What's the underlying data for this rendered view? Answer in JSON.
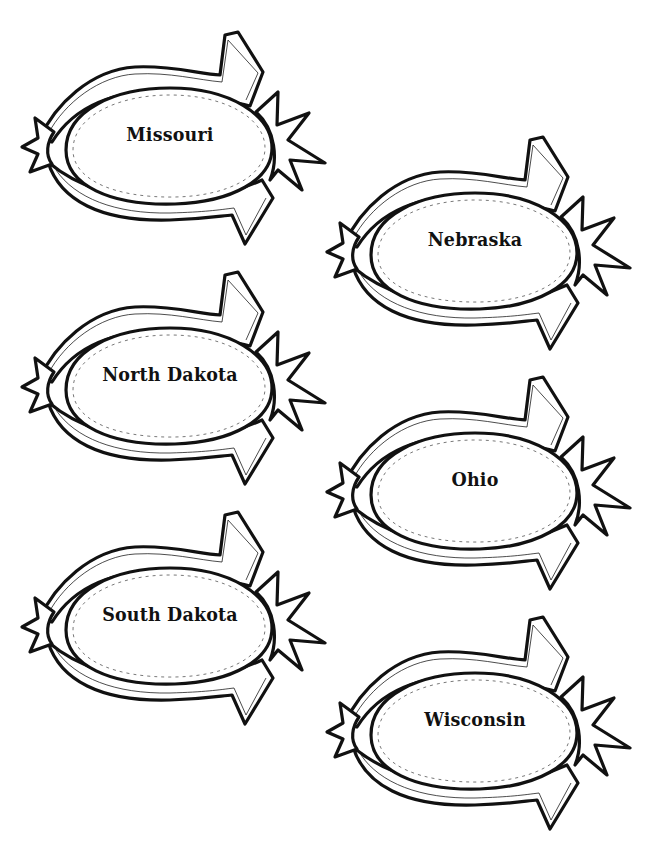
{
  "page": {
    "background": "#ffffff",
    "ink_color": "#111111"
  },
  "badges": [
    {
      "label": "Missouri",
      "x": 20,
      "y": 30
    },
    {
      "label": "Nebraska",
      "x": 325,
      "y": 135
    },
    {
      "label": "North Dakota",
      "x": 20,
      "y": 270
    },
    {
      "label": "Ohio",
      "x": 325,
      "y": 375
    },
    {
      "label": "South Dakota",
      "x": 20,
      "y": 510
    },
    {
      "label": "Wisconsin",
      "x": 325,
      "y": 615
    }
  ]
}
